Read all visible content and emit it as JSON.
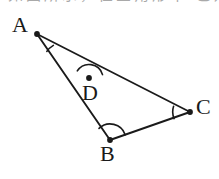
{
  "figure": {
    "background_color": "#ffffff",
    "stroke_color": "#1a1a1a",
    "width": 219,
    "height": 179,
    "cropped_header_text": "如图所示，在三角形中 已知",
    "points": [
      {
        "id": "A",
        "label": "A",
        "x": 37,
        "y": 34
      },
      {
        "id": "D",
        "label": "D",
        "x": 89,
        "y": 78
      },
      {
        "id": "C",
        "label": "C",
        "x": 190,
        "y": 112
      },
      {
        "id": "B",
        "label": "B",
        "x": 110,
        "y": 140
      }
    ],
    "segments": [
      {
        "id": "AC",
        "from": "A",
        "to": "C",
        "note": "passes through D"
      },
      {
        "id": "AB",
        "from": "A",
        "to": "B"
      },
      {
        "id": "BC",
        "from": "B",
        "to": "C"
      }
    ],
    "angle_marks": [
      {
        "id": "angle-A",
        "vertex": "A",
        "radius": 20
      },
      {
        "id": "angle-D",
        "vertex": "D",
        "radius": 14
      },
      {
        "id": "angle-C",
        "vertex": "C",
        "radius": 17
      },
      {
        "id": "angle-B",
        "vertex": "B",
        "radius": 16
      }
    ]
  }
}
